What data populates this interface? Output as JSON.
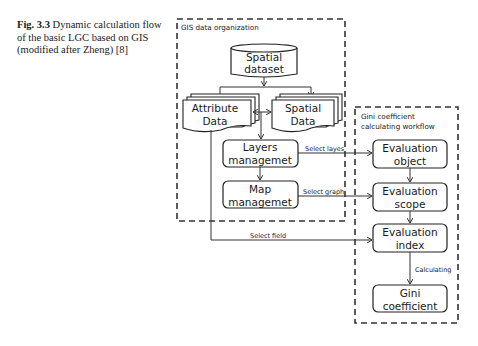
{
  "caption": {
    "figure_label": "Fig. 3.3",
    "text": "Dynamic calculation flow of the basic LGC based on GIS (modified after Zheng) [8]"
  },
  "groups": {
    "gis": {
      "title": "GIS data organization"
    },
    "gini": {
      "title_line1": "Gini coefficient",
      "title_line2": "calculating workflow"
    }
  },
  "nodes": {
    "spatial_dataset": {
      "line1": "Spatial",
      "line2": "dataset"
    },
    "attribute_data": {
      "line1": "Attribute",
      "line2": "Data"
    },
    "spatial_data": {
      "line1": "Spatial",
      "line2": "Data"
    },
    "layers": {
      "line1": "Layers",
      "line2": "managemet"
    },
    "map": {
      "line1": "Map",
      "line2": "managemet"
    },
    "eval_object": {
      "line1": "Evaluation",
      "line2": "object"
    },
    "eval_scope": {
      "line1": "Evaluation",
      "line2": "scope"
    },
    "eval_index": {
      "line1": "Evaluation",
      "line2": "index"
    },
    "gini_coef": {
      "line1": "Gini",
      "line2": "coefficient"
    }
  },
  "edges": {
    "select_layers": "Select layes",
    "select_graph": "Select graph",
    "select_field": "Select field",
    "calculating": "Calculating"
  }
}
